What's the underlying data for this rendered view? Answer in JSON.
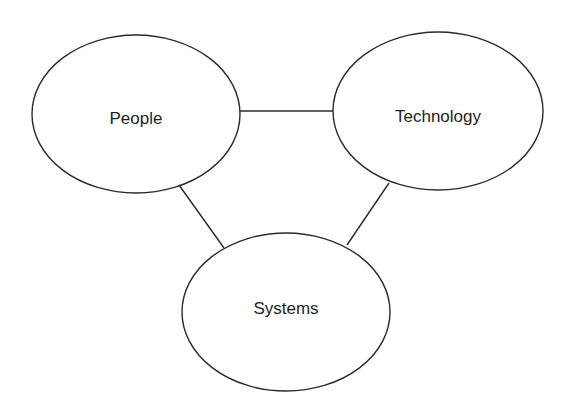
{
  "diagram": {
    "type": "triangle-relationship",
    "colors": {
      "stroke": "#2a2a2a",
      "text": "#1e1e1e",
      "background": "#ffffff"
    },
    "nodes": [
      {
        "id": "people",
        "label": "People",
        "cx": 136,
        "cy": 114,
        "rx": 104,
        "ry": 79
      },
      {
        "id": "technology",
        "label": "Technology",
        "cx": 438,
        "cy": 111,
        "rx": 105,
        "ry": 79
      },
      {
        "id": "systems",
        "label": "Systems",
        "cx": 286,
        "cy": 312,
        "rx": 104,
        "ry": 79
      }
    ],
    "edges": [
      {
        "from": "people",
        "to": "technology"
      },
      {
        "from": "people",
        "to": "systems"
      },
      {
        "from": "technology",
        "to": "systems"
      }
    ]
  }
}
